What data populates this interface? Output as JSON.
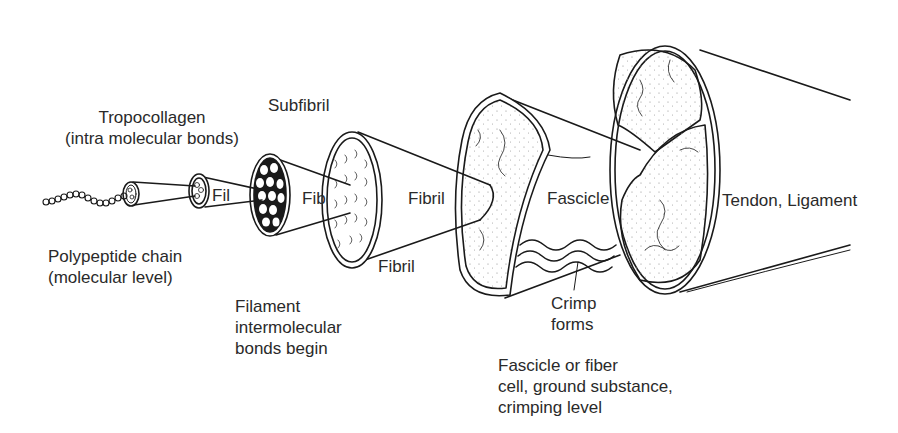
{
  "diagram": {
    "stroke_color": "#1a1a1a",
    "fill_color": "#ffffff",
    "stages": [
      {
        "id": "polypeptide",
        "label_lines": [
          "Polypeptide chain",
          "(molecular level)"
        ]
      },
      {
        "id": "tropocollagen",
        "label_lines": [
          "Tropocollagen",
          "(intra molecular bonds)"
        ]
      },
      {
        "id": "filament",
        "inline_label": "Fil",
        "label_lines": [
          "Filament",
          "intermolecular",
          "bonds begin"
        ]
      },
      {
        "id": "subfibril",
        "inline_label": "Fib",
        "label_lines": [
          "Subfibril"
        ]
      },
      {
        "id": "fibril",
        "inline_label": "Fibril",
        "label_lines": [
          "Fibril"
        ]
      },
      {
        "id": "fascicle",
        "inline_label": "Fascicle",
        "label_lines": [
          "Fascicle or fiber",
          "cell, ground substance,",
          "crimping level"
        ]
      },
      {
        "id": "tendon",
        "label_lines": [
          "Tendon, Ligament"
        ]
      }
    ],
    "callout": {
      "label_lines": [
        "Crimp",
        "forms"
      ]
    }
  }
}
